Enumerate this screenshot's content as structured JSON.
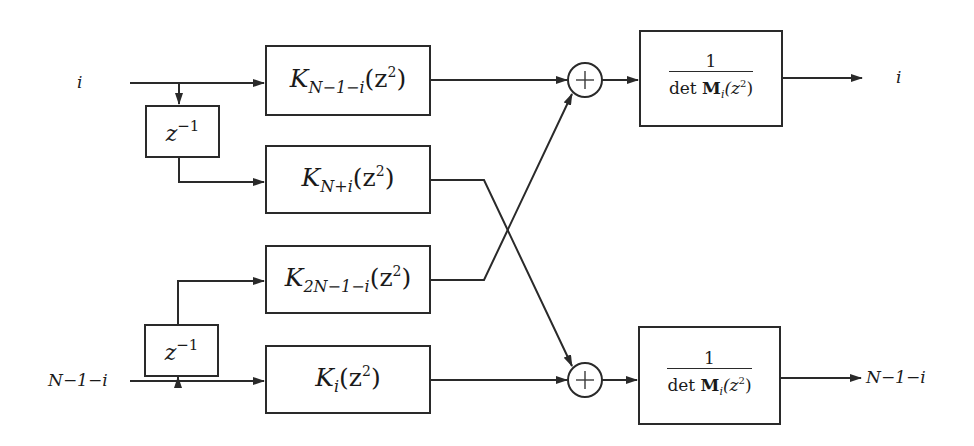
{
  "diagram": {
    "type": "block-diagram",
    "inputs": [
      {
        "id": "in_top",
        "label": "i"
      },
      {
        "id": "in_bottom",
        "label": "N−1−i"
      }
    ],
    "outputs": [
      {
        "id": "out_top",
        "label": "i"
      },
      {
        "id": "out_bottom",
        "label": "N−1−i"
      }
    ],
    "delays": [
      {
        "id": "delay_top",
        "base": "z",
        "exp": "−1"
      },
      {
        "id": "delay_bottom",
        "base": "z",
        "exp": "−1"
      }
    ],
    "filters": [
      {
        "id": "k1",
        "base": "K",
        "sub": "N−1−i",
        "arg": "(z",
        "argexp": "2",
        "close": ")"
      },
      {
        "id": "k2",
        "base": "K",
        "sub": "N+i",
        "arg": "(z",
        "argexp": "2",
        "close": ")"
      },
      {
        "id": "k3",
        "base": "K",
        "sub": "2N−1−i",
        "arg": "(z",
        "argexp": "2",
        "close": ")"
      },
      {
        "id": "k4",
        "base": "K",
        "sub": "i",
        "arg": "(z",
        "argexp": "2",
        "close": ")"
      }
    ],
    "adders": [
      {
        "id": "sum_top",
        "symbol": "+"
      },
      {
        "id": "sum_bottom",
        "symbol": "+"
      }
    ],
    "normalizers": [
      {
        "id": "norm_top",
        "num": "1",
        "den_prefix": "det ",
        "den_matrix": "M",
        "den_sub": "i",
        "den_arg": "(z",
        "den_argexp": "2",
        "den_close": ")"
      },
      {
        "id": "norm_bottom",
        "num": "1",
        "den_prefix": "det ",
        "den_matrix": "M",
        "den_sub": "i",
        "den_arg": "(z",
        "den_argexp": "2",
        "den_close": ")"
      }
    ],
    "edges": [
      [
        "in_top",
        "k1"
      ],
      [
        "in_top",
        "delay_top"
      ],
      [
        "delay_top",
        "k2"
      ],
      [
        "in_bottom",
        "k4"
      ],
      [
        "in_bottom",
        "delay_bottom"
      ],
      [
        "delay_bottom",
        "k3"
      ],
      [
        "k1",
        "sum_top"
      ],
      [
        "k3",
        "sum_top"
      ],
      [
        "k2",
        "sum_bottom"
      ],
      [
        "k4",
        "sum_bottom"
      ],
      [
        "sum_top",
        "norm_top"
      ],
      [
        "sum_bottom",
        "norm_bottom"
      ],
      [
        "norm_top",
        "out_top"
      ],
      [
        "norm_bottom",
        "out_bottom"
      ]
    ],
    "colors": {
      "stroke": "#2a2a2a",
      "background": "#ffffff"
    }
  }
}
